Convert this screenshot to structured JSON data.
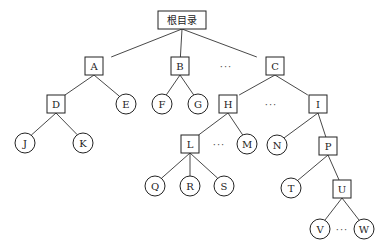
{
  "diagram": {
    "type": "tree",
    "title": "",
    "legend_hint": {
      "box": "directory",
      "circle": "file"
    },
    "nodes": [
      {
        "id": "root",
        "label": "根目录",
        "shape": "box",
        "x": 182,
        "y": 20,
        "w": 48,
        "h": 18
      },
      {
        "id": "A",
        "label": "A",
        "shape": "box",
        "x": 94,
        "y": 66
      },
      {
        "id": "B",
        "label": "B",
        "shape": "box",
        "x": 180,
        "y": 66
      },
      {
        "id": "C",
        "label": "C",
        "shape": "box",
        "x": 275,
        "y": 66
      },
      {
        "id": "D",
        "label": "D",
        "shape": "box",
        "x": 56,
        "y": 104
      },
      {
        "id": "E",
        "label": "E",
        "shape": "circle",
        "x": 126,
        "y": 104
      },
      {
        "id": "F",
        "label": "F",
        "shape": "circle",
        "x": 162,
        "y": 104
      },
      {
        "id": "G",
        "label": "G",
        "shape": "circle",
        "x": 198,
        "y": 104
      },
      {
        "id": "H",
        "label": "H",
        "shape": "box",
        "x": 228,
        "y": 104
      },
      {
        "id": "I",
        "label": "I",
        "shape": "box",
        "x": 318,
        "y": 104
      },
      {
        "id": "J",
        "label": "J",
        "shape": "circle",
        "x": 25,
        "y": 143
      },
      {
        "id": "K",
        "label": "K",
        "shape": "circle",
        "x": 83,
        "y": 143
      },
      {
        "id": "L",
        "label": "L",
        "shape": "box",
        "x": 190,
        "y": 144
      },
      {
        "id": "M",
        "label": "M",
        "shape": "circle",
        "x": 247,
        "y": 144
      },
      {
        "id": "N",
        "label": "N",
        "shape": "circle",
        "x": 277,
        "y": 145
      },
      {
        "id": "P",
        "label": "P",
        "shape": "box",
        "x": 328,
        "y": 146
      },
      {
        "id": "Q",
        "label": "Q",
        "shape": "circle",
        "x": 155,
        "y": 186
      },
      {
        "id": "R",
        "label": "R",
        "shape": "circle",
        "x": 190,
        "y": 186
      },
      {
        "id": "S",
        "label": "S",
        "shape": "circle",
        "x": 224,
        "y": 186
      },
      {
        "id": "T",
        "label": "T",
        "shape": "circle",
        "x": 291,
        "y": 188
      },
      {
        "id": "U",
        "label": "U",
        "shape": "box",
        "x": 342,
        "y": 189
      },
      {
        "id": "V",
        "label": "V",
        "shape": "circle",
        "x": 320,
        "y": 229
      },
      {
        "id": "W",
        "label": "W",
        "shape": "circle",
        "x": 364,
        "y": 229
      }
    ],
    "edges": [
      [
        "root",
        "A"
      ],
      [
        "root",
        "B"
      ],
      [
        "root",
        "C"
      ],
      [
        "A",
        "D"
      ],
      [
        "A",
        "E"
      ],
      [
        "B",
        "F"
      ],
      [
        "B",
        "G"
      ],
      [
        "C",
        "H"
      ],
      [
        "C",
        "I"
      ],
      [
        "D",
        "J"
      ],
      [
        "D",
        "K"
      ],
      [
        "H",
        "L"
      ],
      [
        "H",
        "M"
      ],
      [
        "I",
        "N"
      ],
      [
        "I",
        "P"
      ],
      [
        "L",
        "Q"
      ],
      [
        "L",
        "R"
      ],
      [
        "L",
        "S"
      ],
      [
        "P",
        "T"
      ],
      [
        "P",
        "U"
      ],
      [
        "U",
        "V"
      ],
      [
        "U",
        "W"
      ]
    ],
    "ellipses": [
      {
        "id": "dots-bc",
        "text": "···",
        "x": 226,
        "y": 66
      },
      {
        "id": "dots-hi",
        "text": "···",
        "x": 271,
        "y": 104
      },
      {
        "id": "dots-lm",
        "text": "···",
        "x": 219,
        "y": 144
      },
      {
        "id": "dots-vw",
        "text": "···",
        "x": 342,
        "y": 229
      }
    ]
  }
}
